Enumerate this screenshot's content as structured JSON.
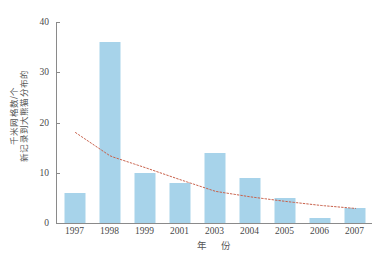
{
  "chart_data": {
    "type": "bar",
    "title": "",
    "subtitle": "",
    "categories": [
      "1997",
      "1998",
      "1999",
      "2001",
      "2003",
      "2004",
      "2005",
      "2006",
      "2007"
    ],
    "values": [
      6,
      36,
      10,
      8,
      14,
      9,
      5,
      1,
      3
    ],
    "series": [
      {
        "name": "新记录到大熊猫分布的千米网格数",
        "type": "bar",
        "values": [
          6,
          36,
          10,
          8,
          14,
          9,
          5,
          1,
          3
        ],
        "color": "#a7d3ea"
      },
      {
        "name": "趋势线",
        "type": "line",
        "style": "dotted",
        "color": "#c8604a",
        "values": [
          18.0,
          13.3,
          11.0,
          8.6,
          6.3,
          5.2,
          4.3,
          3.5,
          2.9
        ]
      }
    ],
    "xlabel": "年  份",
    "ylabel": "新记录到大熊猫分布的千米网格数/个",
    "ylabel_lines": [
      "新记录到大熊猫分布的",
      "千米网格数/个"
    ],
    "ylim": [
      0,
      40
    ],
    "yticks": [
      0,
      10,
      20,
      30,
      40
    ],
    "ytick_labels": [
      "0",
      "10",
      "20",
      "30",
      "40"
    ],
    "grid": false,
    "legend": "none",
    "bar_color": "#a7d3ea",
    "trendline_color": "#c8604a",
    "axis_color": "#8a8a8a",
    "background": "#ffffff"
  },
  "caption": {
    "text": ""
  }
}
